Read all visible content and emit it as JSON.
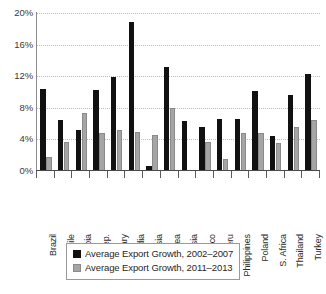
{
  "chart_data": {
    "type": "bar",
    "title": "",
    "subtitle": "",
    "xlabel": "",
    "ylabel": "",
    "ylim": [
      0,
      20
    ],
    "ytick_values": [
      0,
      4,
      8,
      12,
      16,
      20
    ],
    "ytick_labels": [
      "0%",
      "4%",
      "8%",
      "12%",
      "16%",
      "20%"
    ],
    "grid": "horizontal-dotted",
    "legend_position": "bottom-center",
    "categories": [
      "Brazil",
      "Chile",
      "Colombia",
      "Czech Rep.",
      "Hungary",
      "India",
      "Indonesia",
      "S. Korea",
      "Malaysia",
      "Mexico",
      "Peru",
      "Philippines",
      "Poland",
      "S. Africa",
      "Thailand",
      "Turkey"
    ],
    "series": [
      {
        "name": "Average Export Growth, 2002–2007",
        "color": "#111111",
        "values": [
          10.4,
          6.4,
          5.2,
          10.2,
          11.9,
          18.8,
          0.6,
          13.2,
          6.3,
          5.6,
          6.6,
          6.6,
          10.1,
          4.4,
          9.6,
          12.3
        ]
      },
      {
        "name": "Average Export Growth, 2011–2013",
        "color": "#a5a5a5",
        "values": [
          1.8,
          3.7,
          7.3,
          4.8,
          5.2,
          5.0,
          4.5,
          8.0,
          0.0,
          3.7,
          1.5,
          4.8,
          4.8,
          3.6,
          5.6,
          6.5
        ]
      }
    ]
  },
  "legend": {
    "items": [
      {
        "label": "Average Export Growth, 2002–2007",
        "swatch": "black-square"
      },
      {
        "label": "Average Export Growth, 2011–2013",
        "swatch": "gray-square"
      }
    ]
  }
}
